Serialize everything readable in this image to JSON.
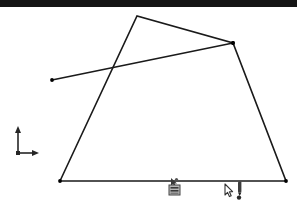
{
  "window": {
    "title": "",
    "titlebar_color": "#151515",
    "background_color": "#ffffff",
    "width": 297,
    "height": 216
  },
  "canvas": {
    "name": "sketch-viewport",
    "stroke_color": "#1a1a1a",
    "vertex_marker_color": "#000000"
  },
  "axis_indicator": {
    "name": "origin-axis-indicator",
    "x_label": "",
    "y_label": "",
    "origin_x": 18,
    "origin_y": 144,
    "color": "#262626"
  },
  "overlay_icons": [
    {
      "name": "pointer-small-icon",
      "label": ""
    },
    {
      "name": "device-icon",
      "label": ""
    },
    {
      "name": "cursor-arrow-icon",
      "label": ""
    },
    {
      "name": "stylus-icon",
      "label": ""
    }
  ],
  "chart_data": {
    "type": "line",
    "title": "",
    "xlabel": "",
    "ylabel": "",
    "grid": false,
    "legend": false,
    "xlim": [
      0,
      297
    ],
    "ylim": [
      216,
      0
    ],
    "series": [
      {
        "name": "quadrilateral-outline",
        "closed": false,
        "stroke_width": 1.6,
        "points": [
          [
            60,
            181
          ],
          [
            137,
            16
          ],
          [
            233,
            43
          ],
          [
            286,
            181
          ],
          [
            60,
            181
          ]
        ],
        "markers": [
          [
            60,
            181
          ],
          [
            233,
            43
          ],
          [
            286,
            181
          ]
        ]
      },
      {
        "name": "crossing-line",
        "closed": false,
        "stroke_width": 1.6,
        "points": [
          [
            52,
            80
          ],
          [
            233,
            43
          ]
        ],
        "markers": [
          [
            52,
            80
          ],
          [
            233,
            43
          ]
        ]
      }
    ],
    "annotations": [
      {
        "name": "intersection-point",
        "x": 113,
        "y": 70
      }
    ]
  }
}
